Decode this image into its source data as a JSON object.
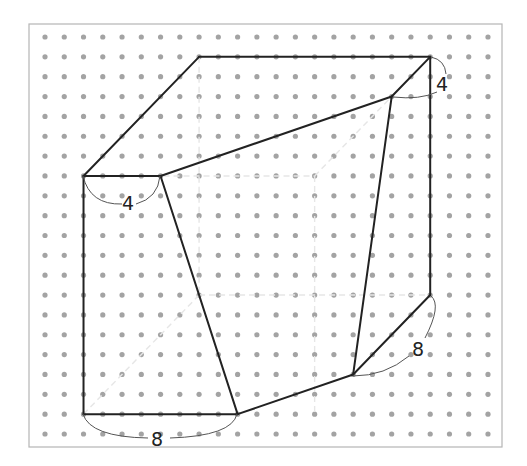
{
  "diagram": {
    "type": "geometry-dot-grid",
    "grid": {
      "columns": 24,
      "rows": 21,
      "dot_color": "#a3a3a3"
    },
    "colors": {
      "edge": "#222222",
      "hidden": "#e6e6e6",
      "frame": "#b5b5b5",
      "brace": "#555555"
    },
    "vertices": {
      "A": [
        2,
        7
      ],
      "B": [
        6,
        7
      ],
      "C": [
        8,
        1
      ],
      "D": [
        20,
        1
      ],
      "E": [
        18,
        3
      ],
      "F": [
        20,
        13
      ],
      "G": [
        16,
        17
      ],
      "H": [
        10,
        19
      ],
      "I": [
        2,
        19
      ],
      "J": [
        14,
        7
      ],
      "K": [
        8,
        13
      ],
      "L": [
        14,
        19
      ]
    },
    "visible_edges": [
      [
        "A",
        "C"
      ],
      [
        "C",
        "D"
      ],
      [
        "D",
        "E"
      ],
      [
        "D",
        "F"
      ],
      [
        "A",
        "B"
      ],
      [
        "B",
        "E"
      ],
      [
        "B",
        "H"
      ],
      [
        "E",
        "G"
      ],
      [
        "F",
        "G"
      ],
      [
        "G",
        "H"
      ],
      [
        "H",
        "I"
      ],
      [
        "I",
        "A"
      ]
    ],
    "hidden_edges": [
      [
        "A",
        "J"
      ],
      [
        "J",
        "D"
      ],
      [
        "J",
        "L"
      ],
      [
        "I",
        "K"
      ],
      [
        "K",
        "F"
      ],
      [
        "C",
        "K"
      ]
    ],
    "labels": [
      {
        "text": "4",
        "from": "A",
        "to": "B",
        "side": "below"
      },
      {
        "text": "4",
        "from": "D",
        "to": "E",
        "side": "right"
      },
      {
        "text": "8",
        "from": "F",
        "to": "G",
        "side": "right"
      },
      {
        "text": "8",
        "from": "I",
        "to": "H",
        "side": "below"
      }
    ]
  }
}
